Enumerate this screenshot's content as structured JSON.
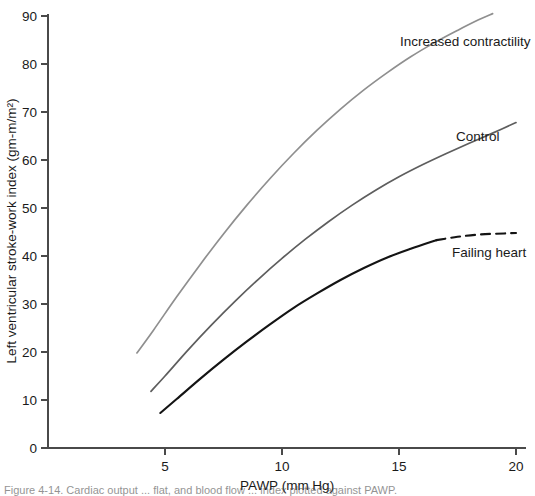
{
  "chart_data": {
    "type": "line",
    "title": "",
    "xlabel": "PAWP (mm Hg)",
    "ylabel": "Left ventricular stroke-work index (gm-m/m²)",
    "xlim": [
      0,
      20.6
    ],
    "ylim": [
      0,
      93
    ],
    "grid": false,
    "legend_position": "inline-right-of-curve",
    "xticks": [
      5,
      10,
      15,
      20
    ],
    "xtick_labels": [
      "5",
      "10",
      "15",
      "20"
    ],
    "yticks": [
      0,
      10,
      20,
      30,
      40,
      50,
      60,
      70,
      80,
      90
    ],
    "ytick_labels": [
      "0",
      "10",
      "20",
      "30",
      "40",
      "50",
      "60",
      "70",
      "80",
      "90"
    ],
    "series": [
      {
        "name": "Increased contractility",
        "color": "#8f8f8f",
        "stroke_width": 1.7,
        "style": "solid",
        "x": [
          3.8,
          4.5,
          5.5,
          6.5,
          7.5,
          8.5,
          9.5,
          10.5,
          11.5,
          12.5,
          13.5,
          14.5,
          15.5,
          16.5,
          17.5,
          18.4,
          19.0
        ],
        "y": [
          19.8,
          24.5,
          31.5,
          38.2,
          44.6,
          50.6,
          56.2,
          61.4,
          66.2,
          70.6,
          74.6,
          78.2,
          81.5,
          84.4,
          87.0,
          89.2,
          90.5
        ]
      },
      {
        "name": "Control",
        "color": "#5e5e5e",
        "stroke_width": 1.7,
        "style": "solid",
        "x": [
          4.4,
          5.0,
          6.0,
          7.0,
          8.0,
          9.0,
          10.0,
          11.0,
          12.0,
          13.0,
          14.0,
          15.0,
          16.0,
          17.0,
          18.0,
          19.0,
          20.0
        ],
        "y": [
          11.8,
          15.0,
          20.5,
          25.7,
          30.6,
          35.2,
          39.5,
          43.5,
          47.2,
          50.6,
          53.7,
          56.5,
          59.0,
          61.3,
          63.5,
          65.6,
          67.8
        ]
      },
      {
        "name": "Failing heart",
        "color": "#141414",
        "stroke_width": 2.1,
        "style": "solid-then-dashed",
        "dash_start_x": 16.6,
        "x": [
          4.8,
          5.5,
          6.5,
          7.5,
          8.5,
          9.5,
          10.5,
          11.5,
          12.5,
          13.5,
          14.5,
          15.5,
          16.6,
          17.5,
          18.5,
          19.5,
          20.0
        ],
        "y": [
          7.3,
          10.2,
          14.4,
          18.4,
          22.2,
          25.8,
          29.2,
          32.2,
          35.0,
          37.5,
          39.7,
          41.5,
          43.3,
          44.0,
          44.5,
          44.7,
          44.8
        ]
      }
    ],
    "annotations": [
      {
        "name": "Increased contractility",
        "text": "Increased contractility",
        "x_px": 400,
        "y_px": 46
      },
      {
        "name": "Control",
        "text": "Control",
        "x_px": 456,
        "y_px": 141
      },
      {
        "name": "Failing heart",
        "text": "Failing heart",
        "x_px": 452,
        "y_px": 257
      }
    ],
    "caption": "Figure 4-14.  Cardiac output ... flat, and blood flow ... index plotted against PAWP."
  },
  "axes_geometry": {
    "x0_px": 48,
    "y0_px": 448,
    "x_per_unit_px": 23.4,
    "y_per_unit_px": 4.8,
    "x_axis_right_px": 526,
    "y_axis_top_px": 14
  }
}
